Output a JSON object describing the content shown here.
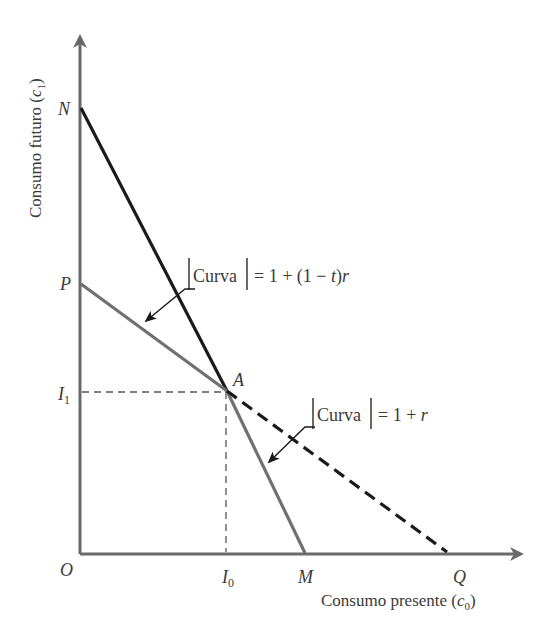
{
  "axes": {
    "y_label": "Consumo futuro",
    "y_label_var": "c",
    "y_label_sub": "1",
    "x_label": "Consumo presente",
    "x_label_var": "c",
    "x_label_sub": "0",
    "origin": "O"
  },
  "points": {
    "N": "N",
    "P": "P",
    "A": "A",
    "M": "M",
    "Q": "Q",
    "I1": "I",
    "I1_sub": "1",
    "I0": "I",
    "I0_sub": "0"
  },
  "annotations": {
    "upper": {
      "curva": "Curva",
      "rhs": "= 1 + (1 − ",
      "t": "t",
      "close": ")",
      "r": "r"
    },
    "lower": {
      "curva": "Curva",
      "rhs": "= 1 + ",
      "r": "r"
    }
  },
  "lines": [
    {
      "name": "NA",
      "style": "solid",
      "color": "#1a1a1a"
    },
    {
      "name": "PM",
      "style": "solid",
      "color": "#6e6e6e"
    },
    {
      "name": "AQ",
      "style": "dashed",
      "color": "#1a1a1a"
    }
  ]
}
